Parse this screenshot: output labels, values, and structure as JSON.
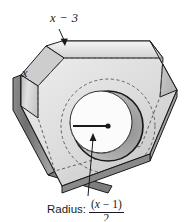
{
  "figure": {
    "background_color": "#ffffff",
    "line_color": "#1a1a1a",
    "labels": {
      "top_edge": {
        "text": "x − 3",
        "variable": "x",
        "operator": "−",
        "constant": "3",
        "name": "top-bevel-dimension"
      },
      "side_edge": {
        "text": "x",
        "name": "side-length-dimension"
      },
      "radius": {
        "prefix": "Radius:",
        "numerator_open": "(",
        "numerator_var": "x",
        "numerator_op": " − ",
        "numerator_const": "1",
        "numerator_close": ")",
        "denominator": "2",
        "full_text": "Radius: (x − 1)/2",
        "name": "hole-radius-dimension"
      }
    },
    "colors": {
      "face_light": "#e8e8e8",
      "face_mid": "#cfcfcf",
      "face_dark": "#9a9a9a",
      "face_darkest": "#6e6e6e",
      "hole_interior": "#ffffff",
      "hole_shadow": "#a8a8a8",
      "outline": "#1a1a1a",
      "hidden_line": "#6a6a6a"
    },
    "geometry": {
      "hole_center_x": 108,
      "hole_center_y": 126,
      "hole_radius": 35,
      "hidden_circle_radius": 47
    }
  }
}
